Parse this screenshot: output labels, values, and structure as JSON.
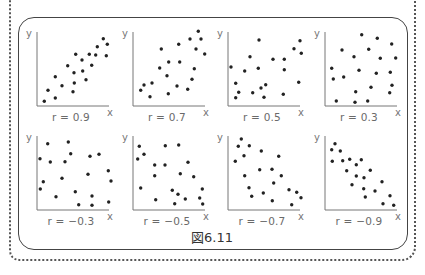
{
  "figure": {
    "caption": "図6.11",
    "axis_x_label": "x",
    "axis_y_label": "y"
  },
  "colors": {
    "dot": "#222222",
    "axis": "#777777",
    "frame": "#444444",
    "dotted_border": "#555555"
  },
  "chart_data": [
    {
      "type": "scatter",
      "title": "r = 0.9",
      "xlabel": "x",
      "ylabel": "y",
      "grid": false,
      "xlim": [
        0,
        75
      ],
      "ylim": [
        0,
        75
      ],
      "x": [
        7.3,
        11,
        18.3,
        18.3,
        25,
        30.7,
        37,
        37.3,
        36,
        38.7,
        45,
        45.7,
        49,
        52.3,
        54.7,
        58.7,
        60.3,
        66.3,
        70.3,
        69.3
      ],
      "y": [
        4.7,
        15.7,
        8,
        29.3,
        20.3,
        40.3,
        33.3,
        23,
        14.3,
        51.7,
        46,
        35,
        26.3,
        51.7,
        40.7,
        51,
        59.3,
        67.3,
        61.7,
        50.3
      ]
    },
    {
      "type": "scatter",
      "title": "r = 0.7",
      "xlabel": "x",
      "ylabel": "y",
      "grid": false,
      "xlim": [
        0,
        75
      ],
      "ylim": [
        0,
        75
      ],
      "x": [
        7.7,
        11,
        19,
        17,
        28.3,
        26.7,
        35.7,
        34,
        35.3,
        44,
        45.7,
        46.7,
        54.7,
        57,
        59,
        61.3,
        63,
        65.3,
        68,
        71.7
      ],
      "y": [
        15.7,
        21,
        23,
        9.3,
        57,
        38,
        44,
        30.3,
        12.3,
        20,
        61.7,
        44,
        16.7,
        67,
        26.7,
        37.3,
        57,
        74.7,
        67,
        52
      ]
    },
    {
      "type": "scatter",
      "title": "r = 0.5",
      "xlabel": "x",
      "ylabel": "y",
      "grid": false,
      "xlim": [
        0,
        75
      ],
      "ylim": [
        0,
        75
      ],
      "x": [
        3,
        7.7,
        10.7,
        7.7,
        16.7,
        22,
        24.7,
        30.3,
        31,
        33,
        36,
        37.7,
        45,
        55.3,
        56.3,
        56.3,
        66,
        70.7,
        72,
        73.3
      ],
      "y": [
        39,
        22.7,
        13.7,
        8.3,
        35,
        49.3,
        13.3,
        37.7,
        66,
        18,
        8.7,
        21.3,
        46.7,
        11.7,
        46.7,
        36.3,
        57.3,
        23.7,
        65.3,
        52.7
      ]
    },
    {
      "type": "scatter",
      "title": "r = 0.3",
      "xlabel": "x",
      "ylabel": "y",
      "grid": false,
      "xlim": [
        0,
        75
      ],
      "ylim": [
        0,
        75
      ],
      "x": [
        6.7,
        8.3,
        17,
        18.7,
        11.3,
        29,
        30.7,
        30,
        34,
        36.7,
        43.7,
        42.7,
        46,
        51.3,
        52.3,
        55.3,
        65.3,
        66.7,
        67,
        64.7,
        70.7
      ],
      "y": [
        37.7,
        27,
        56,
        29,
        5,
        49.3,
        14.3,
        3.7,
        35.7,
        71.3,
        56.7,
        5,
        18.7,
        32.7,
        67.7,
        47.7,
        33.7,
        62,
        20.7,
        13.3,
        48
      ]
    },
    {
      "type": "scatter",
      "title": "r = −0.3",
      "xlabel": "x",
      "ylabel": "y",
      "grid": false,
      "xlim": [
        0,
        75
      ],
      "ylim": [
        0,
        75
      ],
      "x": [
        3,
        10.7,
        13.3,
        6.3,
        3.3,
        19,
        25,
        28,
        31.3,
        33.7,
        38.3,
        41.7,
        51,
        53,
        55,
        55,
        62,
        71.3,
        74,
        71.7
      ],
      "y": [
        51.3,
        66.3,
        48,
        28.3,
        21,
        13.3,
        31.7,
        48.3,
        68,
        56.3,
        18.3,
        5.3,
        35.7,
        53.7,
        4.7,
        14,
        55.7,
        39.3,
        29,
        8
      ]
    },
    {
      "type": "scatter",
      "title": "r = −0.5",
      "xlabel": "x",
      "ylabel": "y",
      "grid": false,
      "xlim": [
        0,
        75
      ],
      "ylim": [
        0,
        75
      ],
      "x": [
        6.3,
        11,
        4.7,
        7.7,
        21.7,
        21.7,
        22.7,
        32.3,
        32,
        45.7,
        47.3,
        55,
        39.3,
        45,
        41.7,
        52.3,
        60.7,
        69.3,
        66.7,
        69.7
      ],
      "y": [
        63.7,
        55.7,
        51,
        22,
        45,
        34.3,
        10.3,
        64.3,
        45,
        65,
        36.3,
        47.7,
        19.7,
        15.7,
        6.3,
        11,
        33.3,
        21,
        12,
        6
      ]
    },
    {
      "type": "scatter",
      "title": "r = −0.7",
      "xlabel": "x",
      "ylabel": "y",
      "grid": false,
      "xlim": [
        0,
        75
      ],
      "ylim": [
        0,
        75
      ],
      "x": [
        13.3,
        10.3,
        21.3,
        7.3,
        16,
        33.3,
        50.7,
        16.7,
        31.7,
        44,
        53.3,
        21,
        23.7,
        35.3,
        45.7,
        44.3,
        61,
        68.7,
        73,
        63.7
      ],
      "y": [
        71,
        63.7,
        64.3,
        48.7,
        54.3,
        59,
        53.7,
        34.3,
        40.3,
        40.7,
        34.3,
        22.3,
        13.7,
        17,
        27,
        9.3,
        20.3,
        17.7,
        12.3,
        5.3
      ]
    },
    {
      "type": "scatter",
      "title": "r = −0.9",
      "xlabel": "x",
      "ylabel": "y",
      "grid": false,
      "xlim": [
        0,
        75
      ],
      "ylim": [
        0,
        75
      ],
      "x": [
        10,
        6.7,
        15.3,
        7.3,
        17.7,
        24.7,
        31.3,
        36.3,
        21.7,
        31.3,
        39,
        45.3,
        27,
        38.7,
        40.3,
        50,
        57,
        65,
        58,
        68.7
      ],
      "y": [
        66.3,
        60.3,
        59,
        48.7,
        49.3,
        50.7,
        45.3,
        50.3,
        39.3,
        34,
        32.3,
        39.7,
        25.3,
        21.3,
        13,
        19,
        28.3,
        14.3,
        6.3,
        4.7
      ]
    }
  ]
}
